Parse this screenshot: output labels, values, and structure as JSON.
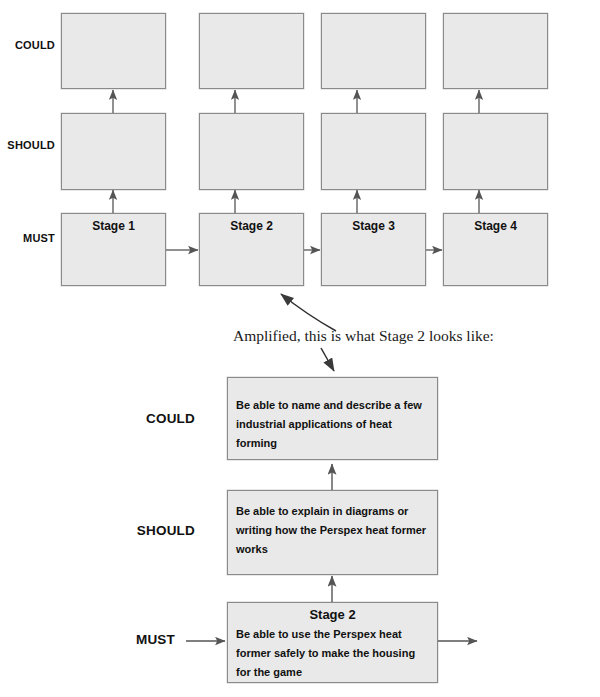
{
  "diagram": {
    "caption": "Amplified, this is what Stage 2 looks like:",
    "colors": {
      "box_fill": "#e9e9e9",
      "box_border": "#8a8a8a",
      "arrow": "#555555",
      "text": "#111111"
    },
    "overview": {
      "row_labels": [
        "COULD",
        "SHOULD",
        "MUST"
      ],
      "columns": [
        {
          "stage_label": "Stage 1",
          "could": "",
          "should": ""
        },
        {
          "stage_label": "Stage 2",
          "could": "",
          "should": ""
        },
        {
          "stage_label": "Stage 3",
          "could": "",
          "should": ""
        },
        {
          "stage_label": "Stage 4",
          "could": "",
          "should": ""
        }
      ]
    },
    "detail": {
      "row_labels": [
        "COULD",
        "SHOULD",
        "MUST"
      ],
      "could_text": "Be able to name and describe a few industrial applications of heat forming",
      "should_text": "Be able to explain in diagrams or writing how the Perspex heat former works",
      "must_title": "Stage 2",
      "must_text": "Be able to use the Perspex heat former safely to make the housing for the game"
    }
  }
}
